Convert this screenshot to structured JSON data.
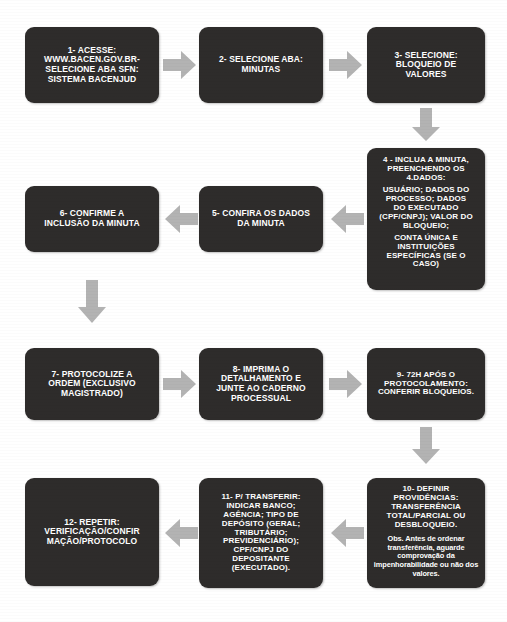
{
  "diagram": {
    "type": "flowchart",
    "box_color": "#2e2c2b",
    "arrow_color": "#b3b3b3",
    "text_color": "#ffffff",
    "background_color": "#ffffff",
    "flow_direction": "serpentine-left-to-right-then-right-to-left"
  },
  "nodes": [
    {
      "id": "step-1",
      "number": "1",
      "lines": [
        "1- ACESSE:",
        "WWW.BACEN.GOV.BR-",
        "SELECIONE ABA SFN:",
        "SISTEMA BACENJUD"
      ]
    },
    {
      "id": "step-2",
      "number": "2",
      "lines": [
        "2- SELECIONE ABA:",
        "MINUTAS"
      ]
    },
    {
      "id": "step-3",
      "number": "3",
      "lines": [
        "3- SELECIONE:",
        "BLOQUEIO DE",
        "VALORES"
      ]
    },
    {
      "id": "step-4",
      "number": "4",
      "lines": [
        "4 - INCLUA A MINUTA,",
        "PREENCHENDO OS",
        "4.DADOS:",
        "USUÁRIO;  DADOS DO",
        "PROCESSO; DADOS",
        "DO EXECUTADO",
        "(CPF/CNPJ); VALOR DO",
        "BLOQUEIO;",
        "CONTA ÚNICA E",
        "INSTITUIÇÕES",
        "ESPECÍFICAS (SE O",
        "CASO)"
      ]
    },
    {
      "id": "step-5",
      "number": "5",
      "lines": [
        "5- CONFIRA OS DADOS",
        "DA MINUTA"
      ]
    },
    {
      "id": "step-6",
      "number": "6",
      "lines": [
        "6- CONFIRME A",
        "INCLUSÃO DA MINUTA"
      ]
    },
    {
      "id": "step-7",
      "number": "7",
      "lines": [
        "7- PROTOCOLIZE  A",
        "ORDEM (EXCLUSIVO",
        "MAGISTRADO)"
      ]
    },
    {
      "id": "step-8",
      "number": "8",
      "lines": [
        "8- IMPRIMA O",
        "DETALHAMENTO E",
        "JUNTE AO CADERNO",
        "PROCESSUAL"
      ]
    },
    {
      "id": "step-9",
      "number": "9",
      "lines": [
        "9- 72H APÓS  O",
        "PROTOCOLAMENTO:",
        "CONFERIR BLOQUEIOS."
      ]
    },
    {
      "id": "step-10",
      "number": "10",
      "lines": [
        "10- DEFINIR",
        "PROVIDÊNCIAS:",
        "TRANSFERÊNCIA",
        "TOTAL/PARCIAL  OU",
        "DESBLOQUEIO."
      ],
      "note": "Obs. Antes de ordenar transferência, aguarde comprovação da impenhorabilidade ou não dos valores."
    },
    {
      "id": "step-11",
      "number": "11",
      "lines": [
        "11- P/ TRANSFERIR:",
        "INDICAR BANCO;",
        "AGÊNCIA; TIPO DE",
        "DEPÓSITO (GERAL;",
        "TRIBUTÁRIO;",
        "PREVIDENCIÁRIO);",
        "CPF/CNPJ DO",
        "DEPOSITANTE",
        "(EXECUTADO)."
      ]
    },
    {
      "id": "step-12",
      "number": "12",
      "lines": [
        "12- REPETIR:",
        "VERIFICAÇÃO/CONFIR",
        "MAÇÃO/PROTOCOLO"
      ]
    }
  ],
  "arrows": [
    {
      "id": "arrow-1-2",
      "direction": "right",
      "from": "step-1",
      "to": "step-2"
    },
    {
      "id": "arrow-2-3",
      "direction": "right",
      "from": "step-2",
      "to": "step-3"
    },
    {
      "id": "arrow-3-4",
      "direction": "down",
      "from": "step-3",
      "to": "step-4"
    },
    {
      "id": "arrow-4-5",
      "direction": "left",
      "from": "step-4",
      "to": "step-5"
    },
    {
      "id": "arrow-5-6",
      "direction": "left",
      "from": "step-5",
      "to": "step-6"
    },
    {
      "id": "arrow-6-7",
      "direction": "down",
      "from": "step-6",
      "to": "step-7"
    },
    {
      "id": "arrow-7-8",
      "direction": "right",
      "from": "step-7",
      "to": "step-8"
    },
    {
      "id": "arrow-8-9",
      "direction": "right",
      "from": "step-8",
      "to": "step-9"
    },
    {
      "id": "arrow-9-10",
      "direction": "down",
      "from": "step-9",
      "to": "step-10"
    },
    {
      "id": "arrow-10-11",
      "direction": "left",
      "from": "step-10",
      "to": "step-11"
    },
    {
      "id": "arrow-11-12",
      "direction": "left",
      "from": "step-11",
      "to": "step-12"
    }
  ]
}
